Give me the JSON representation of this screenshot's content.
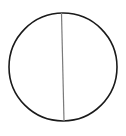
{
  "diagram": {
    "circle": {
      "cx": 63,
      "cy": 67,
      "r": 54,
      "stroke": "#1a1a1a",
      "stroke_width": 1.6
    },
    "chord": {
      "x1": 61.5,
      "y1": 13,
      "x2": 64,
      "y2": 121,
      "stroke": "#7a7a7a",
      "stroke_width": 1.2
    },
    "background": "#ffffff"
  }
}
